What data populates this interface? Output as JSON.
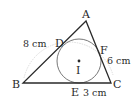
{
  "diagram": {
    "type": "triangle-incircle",
    "vertices": [
      {
        "name": "A",
        "x": 86,
        "y": 21
      },
      {
        "name": "B",
        "x": 23,
        "y": 83
      },
      {
        "name": "C",
        "x": 111,
        "y": 83
      }
    ],
    "incircle": {
      "center_label": "I",
      "cx": 79,
      "cy": 61,
      "r": 22
    },
    "tangent_points": [
      {
        "name": "D",
        "side": "AB"
      },
      {
        "name": "E",
        "side": "BC"
      },
      {
        "name": "F",
        "side": "AC"
      }
    ],
    "labels": {
      "A": "A",
      "B": "B",
      "C": "C",
      "D": "D",
      "E": "E",
      "F": "F",
      "I": "I",
      "AB_length": "8 cm",
      "AC_length": "6 cm",
      "EC_length": "3 cm"
    },
    "colors": {
      "line": "#2a2a2a",
      "circle": "#555555",
      "arc": "#cfcfcf"
    }
  }
}
